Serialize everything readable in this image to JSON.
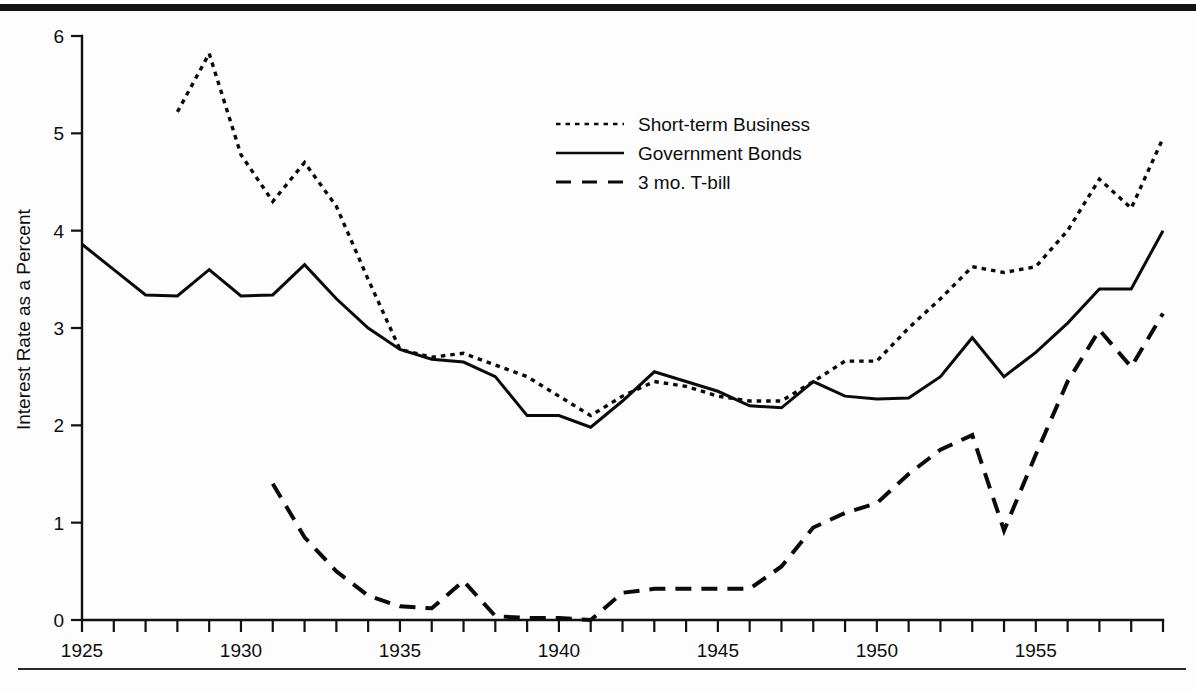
{
  "chart_data": {
    "type": "line",
    "title": "",
    "subtitle": "",
    "xlabel": "",
    "ylabel": "Interest Rate as a Percent",
    "xlim": [
      1925,
      1959
    ],
    "ylim": [
      0,
      6
    ],
    "grid": false,
    "legend_position": "upper-center",
    "y_ticks": [
      0,
      1,
      2,
      3,
      4,
      5,
      6
    ],
    "y_tick_labels": [
      "0",
      "1",
      "2",
      "3",
      "4",
      "5",
      "6"
    ],
    "x_ticks": [
      1925,
      1926,
      1927,
      1928,
      1929,
      1930,
      1931,
      1932,
      1933,
      1934,
      1935,
      1936,
      1937,
      1938,
      1939,
      1940,
      1941,
      1942,
      1943,
      1944,
      1945,
      1946,
      1947,
      1948,
      1949,
      1950,
      1951,
      1952,
      1953,
      1954,
      1955,
      1956,
      1957,
      1958,
      1959
    ],
    "x_tick_labels": [
      "1925",
      "",
      "",
      "",
      "",
      "1930",
      "",
      "",
      "",
      "",
      "1935",
      "",
      "",
      "",
      "",
      "1940",
      "",
      "",
      "",
      "",
      "1945",
      "",
      "",
      "",
      "",
      "1950",
      "",
      "",
      "",
      "",
      "1955",
      "",
      "",
      "",
      ""
    ],
    "x_labeled_ticks": [
      1925,
      1930,
      1935,
      1940,
      1945,
      1950,
      1955
    ],
    "series": [
      {
        "name": "Short-term Business",
        "style": "dotted",
        "color": "#0a0a0a",
        "x": [
          1928,
          1929,
          1930,
          1931,
          1932,
          1933,
          1934,
          1935,
          1936,
          1937,
          1938,
          1939,
          1940,
          1941,
          1942,
          1943,
          1944,
          1945,
          1946,
          1947,
          1948,
          1949,
          1950,
          1951,
          1952,
          1953,
          1954,
          1955,
          1956,
          1957,
          1958,
          1959
        ],
        "values": [
          5.22,
          5.82,
          4.78,
          4.3,
          4.7,
          4.25,
          3.5,
          2.78,
          2.7,
          2.74,
          2.62,
          2.5,
          2.3,
          2.1,
          2.3,
          2.45,
          2.4,
          2.3,
          2.25,
          2.25,
          2.45,
          2.66,
          2.66,
          3.0,
          3.3,
          3.63,
          3.57,
          3.63,
          4.0,
          4.53,
          4.23,
          4.95
        ]
      },
      {
        "name": "Government Bonds",
        "style": "solid",
        "color": "#0a0a0a",
        "x": [
          1925,
          1926,
          1927,
          1928,
          1929,
          1930,
          1931,
          1932,
          1933,
          1934,
          1935,
          1936,
          1937,
          1938,
          1939,
          1940,
          1941,
          1942,
          1943,
          1944,
          1945,
          1946,
          1947,
          1948,
          1949,
          1950,
          1951,
          1952,
          1953,
          1954,
          1955,
          1956,
          1957,
          1958,
          1959
        ],
        "values": [
          3.86,
          3.6,
          3.34,
          3.33,
          3.6,
          3.33,
          3.34,
          3.65,
          3.3,
          3.0,
          2.78,
          2.68,
          2.65,
          2.5,
          2.1,
          2.1,
          1.98,
          2.25,
          2.55,
          2.45,
          2.35,
          2.2,
          2.18,
          2.45,
          2.3,
          2.27,
          2.28,
          2.5,
          2.9,
          2.5,
          2.75,
          3.05,
          3.4,
          3.4,
          4.0
        ]
      },
      {
        "name": "3 mo. T-bill",
        "style": "dashed",
        "color": "#0a0a0a",
        "x": [
          1931,
          1932,
          1933,
          1934,
          1935,
          1936,
          1937,
          1938,
          1939,
          1940,
          1941,
          1942,
          1943,
          1944,
          1945,
          1946,
          1947,
          1948,
          1949,
          1950,
          1951,
          1952,
          1953,
          1954,
          1955,
          1956,
          1957,
          1958,
          1959
        ],
        "values": [
          1.4,
          0.85,
          0.5,
          0.25,
          0.14,
          0.12,
          0.4,
          0.04,
          0.02,
          0.02,
          0.0,
          0.28,
          0.32,
          0.32,
          0.32,
          0.32,
          0.55,
          0.95,
          1.1,
          1.2,
          1.5,
          1.75,
          1.9,
          0.92,
          1.7,
          2.45,
          2.98,
          2.6,
          3.15
        ]
      }
    ]
  },
  "legend": {
    "entries": [
      {
        "label": "Short-term Business",
        "style": "dotted"
      },
      {
        "label": "Government Bonds",
        "style": "solid"
      },
      {
        "label": "3 mo. T-bill",
        "style": "dashed"
      }
    ]
  },
  "axes": {
    "y_axis_title": "Interest Rate as a Percent"
  }
}
